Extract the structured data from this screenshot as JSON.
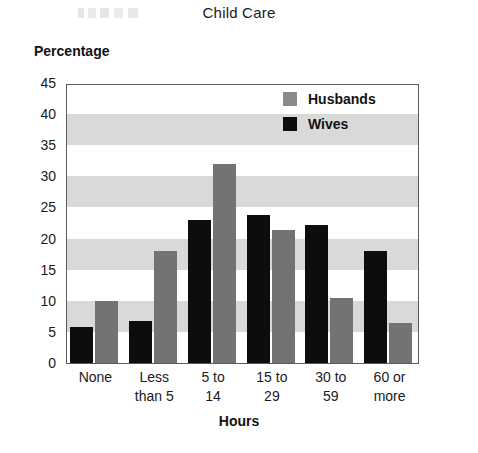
{
  "chart_data": {
    "type": "bar",
    "title": "Child Care",
    "xlabel": "Hours",
    "ylabel": "Percentage",
    "categories": [
      "None",
      "Less\nthan 5",
      "5 to\n14",
      "15 to\n29",
      "30 to\n59",
      "60 or\nmore"
    ],
    "category_lines": [
      [
        "None",
        ""
      ],
      [
        "Less",
        "than 5"
      ],
      [
        "5 to",
        "14"
      ],
      [
        "15 to",
        "29"
      ],
      [
        "30 to",
        "59"
      ],
      [
        "60 or",
        "more"
      ]
    ],
    "series": [
      {
        "name": "Wives",
        "color": "#0d0d0d",
        "values": [
          5.8,
          6.8,
          23.0,
          23.8,
          22.2,
          18.0
        ]
      },
      {
        "name": "Husbands",
        "color": "#737373",
        "values": [
          10.0,
          18.0,
          32.0,
          21.4,
          10.5,
          6.4
        ]
      }
    ],
    "series_draw_order": [
      "Wives",
      "Husbands"
    ],
    "ylim": [
      0,
      45
    ],
    "yticks": [
      0,
      5,
      10,
      15,
      20,
      25,
      30,
      35,
      40,
      45
    ],
    "grid": "horizontal-bands",
    "band_ranges": [
      [
        5,
        10
      ],
      [
        15,
        20
      ],
      [
        25,
        30
      ],
      [
        35,
        40
      ]
    ],
    "band_color": "#d9d9d9",
    "legend_position": "top-right",
    "legend_entries": [
      "Husbands",
      "Wives"
    ]
  }
}
